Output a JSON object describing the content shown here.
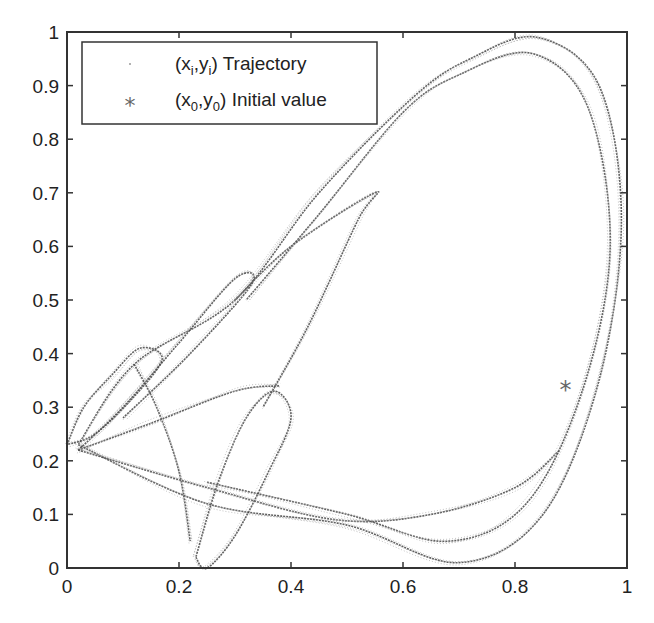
{
  "chart_data": {
    "type": "scatter",
    "title": "",
    "xlabel": "",
    "ylabel": "",
    "xlim": [
      0,
      1
    ],
    "ylim": [
      0,
      1
    ],
    "grid": false,
    "legend_position": "upper left",
    "x_ticks": [
      "0",
      "0.2",
      "0.4",
      "0.6",
      "0.8",
      "1"
    ],
    "y_ticks": [
      "0",
      "0.1",
      "0.2",
      "0.3",
      "0.4",
      "0.5",
      "0.6",
      "0.7",
      "0.8",
      "0.9",
      "1"
    ],
    "series": [
      {
        "name": "(x_i,y_i) Trajectory",
        "marker": "dot",
        "description": "chaotic attractor trajectory points forming loops",
        "loops": [
          {
            "label": "large outer loop",
            "points": [
              [
                0.02,
                0.23
              ],
              [
                0.25,
                0.12
              ],
              [
                0.5,
                0.08
              ],
              [
                0.7,
                0.01
              ],
              [
                0.85,
                0.1
              ],
              [
                0.95,
                0.35
              ],
              [
                0.99,
                0.65
              ],
              [
                0.95,
                0.9
              ],
              [
                0.84,
                0.99
              ],
              [
                0.72,
                0.95
              ],
              [
                0.62,
                0.88
              ],
              [
                0.45,
                0.7
              ],
              [
                0.3,
                0.5
              ],
              [
                0.12,
                0.38
              ],
              [
                0.02,
                0.23
              ]
            ]
          },
          {
            "label": "inner outer loop",
            "points": [
              [
                0.25,
                0.16
              ],
              [
                0.5,
                0.1
              ],
              [
                0.68,
                0.05
              ],
              [
                0.82,
                0.12
              ],
              [
                0.92,
                0.33
              ],
              [
                0.97,
                0.6
              ],
              [
                0.93,
                0.86
              ],
              [
                0.83,
                0.96
              ],
              [
                0.7,
                0.92
              ],
              [
                0.6,
                0.85
              ],
              [
                0.45,
                0.66
              ],
              [
                0.32,
                0.5
              ]
            ]
          },
          {
            "label": "left ellipse",
            "points": [
              [
                0.0,
                0.23
              ],
              [
                0.03,
                0.3
              ],
              [
                0.08,
                0.36
              ],
              [
                0.13,
                0.41
              ],
              [
                0.17,
                0.39
              ],
              [
                0.12,
                0.32
              ],
              [
                0.05,
                0.25
              ],
              [
                0.0,
                0.23
              ]
            ]
          },
          {
            "label": "mid-left wedge",
            "points": [
              [
                0.02,
                0.22
              ],
              [
                0.1,
                0.3
              ],
              [
                0.2,
                0.42
              ],
              [
                0.3,
                0.54
              ],
              [
                0.33,
                0.53
              ],
              [
                0.22,
                0.4
              ],
              [
                0.1,
                0.28
              ]
            ]
          },
          {
            "label": "lower ellipse",
            "points": [
              [
                0.23,
                0.02
              ],
              [
                0.25,
                0.0
              ],
              [
                0.3,
                0.06
              ],
              [
                0.36,
                0.18
              ],
              [
                0.4,
                0.28
              ],
              [
                0.37,
                0.33
              ],
              [
                0.32,
                0.28
              ],
              [
                0.27,
                0.16
              ],
              [
                0.23,
                0.02
              ]
            ]
          },
          {
            "label": "upper wedge",
            "points": [
              [
                0.3,
                0.5
              ],
              [
                0.4,
                0.6
              ],
              [
                0.55,
                0.7
              ],
              [
                0.52,
                0.65
              ],
              [
                0.43,
                0.45
              ],
              [
                0.35,
                0.3
              ]
            ]
          },
          {
            "label": "arc crossing",
            "points": [
              [
                0.02,
                0.22
              ],
              [
                0.15,
                0.27
              ],
              [
                0.3,
                0.33
              ],
              [
                0.38,
                0.34
              ]
            ]
          },
          {
            "label": "descending strand",
            "points": [
              [
                0.12,
                0.38
              ],
              [
                0.16,
                0.3
              ],
              [
                0.2,
                0.18
              ],
              [
                0.22,
                0.05
              ]
            ]
          },
          {
            "label": "diagonal strand",
            "points": [
              [
                0.02,
                0.22
              ],
              [
                0.25,
                0.15
              ],
              [
                0.48,
                0.09
              ],
              [
                0.65,
                0.1
              ],
              [
                0.8,
                0.15
              ],
              [
                0.88,
                0.22
              ]
            ]
          }
        ]
      },
      {
        "name": "(x_0,y_0) Initial value",
        "marker": "asterisk",
        "x": [
          0.89
        ],
        "y": [
          0.334
        ]
      }
    ]
  },
  "legend": {
    "items": [
      {
        "var": "x",
        "sub1": "i",
        "var2": "y",
        "sub2": "i",
        "text": "Trajectory"
      },
      {
        "var": "x",
        "sub1": "0",
        "var2": "y",
        "sub2": "0",
        "text": "Initial value"
      }
    ]
  },
  "colors": {
    "axis": "#333333",
    "trajectory": "#444444",
    "trajectory_light": "#9a9a9a",
    "marker": "#666666"
  }
}
